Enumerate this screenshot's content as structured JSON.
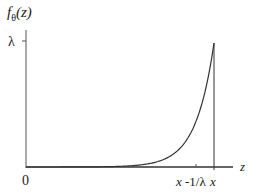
{
  "chart_data": {
    "type": "line",
    "title": "",
    "ylabel": "f_θ(z)",
    "xlabel": "z",
    "y_ticks": [
      "λ"
    ],
    "x_ticks": [
      "0",
      "x-1/λ",
      "x"
    ],
    "series": [
      {
        "name": "f_theta(z)",
        "x": [
          "0",
          "x-1/λ",
          "x"
        ],
        "values": [
          0.0,
          0.37,
          1.0
        ],
        "note": "values relative to λ"
      }
    ],
    "grid": false,
    "legend": null
  },
  "labels": {
    "y_axis_f": "f",
    "y_axis_sub": "θ",
    "y_axis_arg": "(z)",
    "lambda": "λ",
    "origin": "0",
    "x_minus": "x",
    "x_minus_rest": " -1/λ",
    "x": "x",
    "z": "z"
  }
}
